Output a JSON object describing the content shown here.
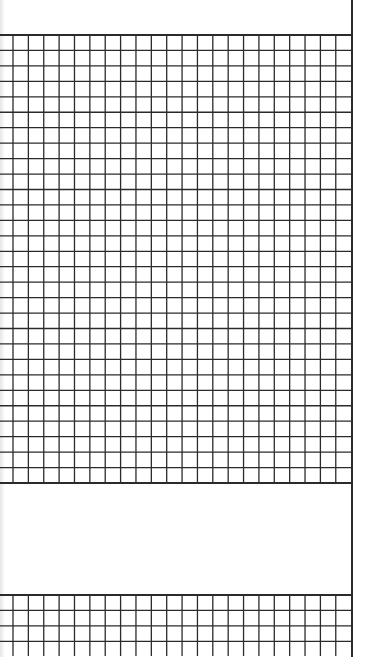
{
  "sheet": {
    "type": "graph-paper",
    "background_color": "#ffffff",
    "line_color": "#2b2b2b",
    "right_border_x": 351,
    "cell_width": 15.37,
    "cell_height": 15.45,
    "first_vertical_x": 13,
    "vertical_count": 23
  },
  "main_grid": {
    "top_y": 35,
    "bottom_y": 483,
    "rows": 29
  },
  "lower_grid": {
    "top_y": 595,
    "rows": 4,
    "vertical_extent_y": 656
  },
  "blank_area": {
    "top_y": 484,
    "bottom_y": 595
  }
}
